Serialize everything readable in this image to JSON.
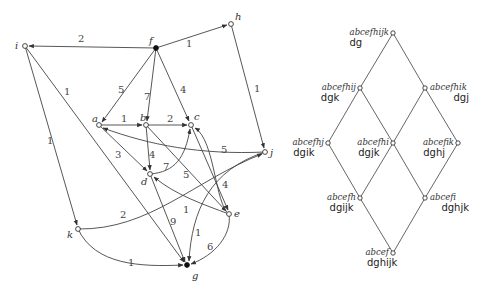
{
  "graph": {
    "nodes": [
      {
        "id": "i",
        "label": "i",
        "x": 25,
        "y": 46,
        "filled": false,
        "lx": -10,
        "ly": 3
      },
      {
        "id": "f",
        "label": "f",
        "x": 156,
        "y": 48,
        "filled": true,
        "lx": -7,
        "ly": -4
      },
      {
        "id": "h",
        "label": "h",
        "x": 231,
        "y": 24,
        "filled": false,
        "lx": 4,
        "ly": -4
      },
      {
        "id": "a",
        "label": "a",
        "x": 99,
        "y": 125,
        "filled": false,
        "lx": -7,
        "ly": -3
      },
      {
        "id": "b",
        "label": "b",
        "x": 146,
        "y": 125,
        "filled": false,
        "lx": -6,
        "ly": -4
      },
      {
        "id": "c",
        "label": "c",
        "x": 191,
        "y": 125,
        "filled": false,
        "lx": 3,
        "ly": -5
      },
      {
        "id": "j",
        "label": "j",
        "x": 265,
        "y": 152,
        "filled": false,
        "lx": 5,
        "ly": 4
      },
      {
        "id": "d",
        "label": "d",
        "x": 150,
        "y": 174,
        "filled": false,
        "lx": -9,
        "ly": 11
      },
      {
        "id": "e",
        "label": "e",
        "x": 229,
        "y": 214,
        "filled": false,
        "lx": 5,
        "ly": 3
      },
      {
        "id": "k",
        "label": "k",
        "x": 78,
        "y": 229,
        "filled": false,
        "lx": -11,
        "ly": 9
      },
      {
        "id": "g",
        "label": "g",
        "x": 187,
        "y": 265,
        "filled": true,
        "lx": 5,
        "ly": 14
      }
    ],
    "edges": [
      {
        "from": "f",
        "to": "i",
        "weight": "2",
        "path": "M156,48 L29,46",
        "lx": 78,
        "ly": 42
      },
      {
        "from": "f",
        "to": "h",
        "weight": "1",
        "path": "M156,48 L227,25",
        "lx": 186,
        "ly": 47
      },
      {
        "from": "f",
        "to": "a",
        "weight": "5",
        "path": "M156,48 L102,122",
        "lx": 118,
        "ly": 93
      },
      {
        "from": "f",
        "to": "b",
        "weight": "7",
        "path": "M156,48 L147,121",
        "lx": 144,
        "ly": 100
      },
      {
        "from": "f",
        "to": "c",
        "weight": "4",
        "path": "M156,48 L189,121",
        "lx": 180,
        "ly": 93
      },
      {
        "from": "h",
        "to": "j",
        "weight": "1",
        "path": "M231,24 L264,148",
        "lx": 254,
        "ly": 92
      },
      {
        "from": "i",
        "to": "k",
        "weight": "1",
        "path": "M25,46 L77,225",
        "lx": 47,
        "ly": 144
      },
      {
        "from": "i",
        "to": "g",
        "weight": "1",
        "path": "M25,46 L184,262",
        "lx": 64,
        "ly": 95
      },
      {
        "from": "a",
        "to": "b",
        "weight": "1",
        "path": "M99,125 L142,125",
        "lx": 121,
        "ly": 122
      },
      {
        "from": "b",
        "to": "c",
        "weight": "2",
        "path": "M146,125 L187,125",
        "lx": 167,
        "ly": 122
      },
      {
        "from": "a",
        "to": "d",
        "weight": "3",
        "path": "M99,125 L147,171",
        "lx": 115,
        "ly": 158
      },
      {
        "from": "b",
        "to": "d",
        "weight": "4",
        "path": "M146,125 L150,170",
        "lx": 149,
        "ly": 158
      },
      {
        "from": "b",
        "to": "e",
        "weight": "5",
        "path": "M146,125 L226,211",
        "lx": 183,
        "ly": 178
      },
      {
        "from": "c",
        "to": "e",
        "weight": "4",
        "path": "M191,125 L228,210",
        "lx": 222,
        "ly": 188
      },
      {
        "from": "d",
        "to": "c",
        "weight": "7",
        "path": "M150,174 C175,172 185,158 190,129",
        "lx": 163,
        "ly": 170
      },
      {
        "from": "j",
        "to": "a",
        "weight": "5",
        "path": "M265,152 C200,155 150,145 103,128",
        "lx": 221,
        "ly": 153
      },
      {
        "from": "e",
        "to": "d",
        "weight": "1",
        "path": "M229,214 C205,205 175,195 154,177",
        "lx": 183,
        "ly": 213
      },
      {
        "from": "e",
        "to": "c",
        "weight": "",
        "path": "M229,214 C215,205 215,140 195,128",
        "lx": 0,
        "ly": 0
      },
      {
        "from": "k",
        "to": "j",
        "weight": "2",
        "path": "M78,229 C150,230 195,180 262,154",
        "lx": 120,
        "ly": 218
      },
      {
        "from": "k",
        "to": "g",
        "weight": "1",
        "path": "M78,229 C95,265 140,267 183,265",
        "lx": 128,
        "ly": 266
      },
      {
        "from": "d",
        "to": "g",
        "weight": "9",
        "path": "M150,174 L185,262",
        "lx": 170,
        "ly": 225
      },
      {
        "from": "j",
        "to": "g",
        "weight": "1",
        "path": "M265,152 C210,170 192,210 189,261",
        "lx": 195,
        "ly": 236
      },
      {
        "from": "e",
        "to": "g",
        "weight": "6",
        "path": "M229,214 C232,235 215,255 191,264",
        "lx": 207,
        "ly": 250
      }
    ]
  },
  "lattice": {
    "nodes": [
      {
        "id": "top",
        "top": "abcefhijk",
        "bottom": "dg",
        "x": 393,
        "y": 33,
        "side": "left"
      },
      {
        "id": "l1",
        "top": "abcefhij",
        "bottom": "dgk",
        "x": 360,
        "y": 88,
        "side": "left"
      },
      {
        "id": "r1",
        "top": "abcefhik",
        "bottom": "dgj",
        "x": 425,
        "y": 88,
        "side": "right"
      },
      {
        "id": "l2",
        "top": "abcefhj",
        "bottom": "dgik",
        "x": 328,
        "y": 143,
        "side": "left"
      },
      {
        "id": "m2",
        "top": "abcefhi",
        "bottom": "dgjk",
        "x": 393,
        "y": 143,
        "side": "left"
      },
      {
        "id": "r2",
        "top": "abcefik",
        "bottom": "dghj",
        "x": 458,
        "y": 143,
        "side": "left"
      },
      {
        "id": "l3",
        "top": "abcefh",
        "bottom": "dgijk",
        "x": 360,
        "y": 198,
        "side": "left"
      },
      {
        "id": "r3",
        "top": "abcefi",
        "bottom": "dghjk",
        "x": 425,
        "y": 198,
        "side": "right"
      },
      {
        "id": "bot",
        "top": "abcef",
        "bottom": "dghijk",
        "x": 393,
        "y": 253,
        "side": "left"
      }
    ],
    "edges": [
      [
        "top",
        "l1"
      ],
      [
        "top",
        "r1"
      ],
      [
        "l1",
        "l2"
      ],
      [
        "l1",
        "m2"
      ],
      [
        "r1",
        "m2"
      ],
      [
        "r1",
        "r2"
      ],
      [
        "l2",
        "l3"
      ],
      [
        "m2",
        "l3"
      ],
      [
        "m2",
        "r3"
      ],
      [
        "r2",
        "r3"
      ],
      [
        "l3",
        "bot"
      ],
      [
        "r3",
        "bot"
      ]
    ]
  }
}
